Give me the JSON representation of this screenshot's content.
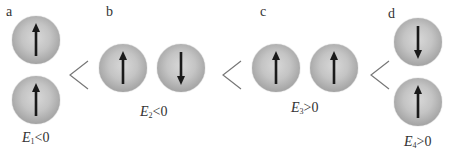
{
  "diagram": {
    "relation_symbol": "<",
    "panels": [
      {
        "id": "a",
        "label": "a",
        "arrangement": "vertical",
        "spins": [
          "up",
          "up"
        ],
        "energy": {
          "symbol": "E",
          "subscript": "1",
          "relation": "<0"
        }
      },
      {
        "id": "b",
        "label": "b",
        "arrangement": "horizontal",
        "spins": [
          "up",
          "down"
        ],
        "energy": {
          "symbol": "E",
          "subscript": "2",
          "relation": "<0"
        }
      },
      {
        "id": "c",
        "label": "c",
        "arrangement": "horizontal",
        "spins": [
          "up",
          "up"
        ],
        "energy": {
          "symbol": "E",
          "subscript": "3",
          "relation": ">0"
        }
      },
      {
        "id": "d",
        "label": "d",
        "arrangement": "vertical",
        "spins": [
          "down",
          "up"
        ],
        "energy": {
          "symbol": "E",
          "subscript": "4",
          "relation": ">0"
        }
      }
    ],
    "colors": {
      "sphere": "#b8b8b8",
      "arrow": "#1a1a1a",
      "relation": "#777777",
      "text": "#333333"
    }
  }
}
